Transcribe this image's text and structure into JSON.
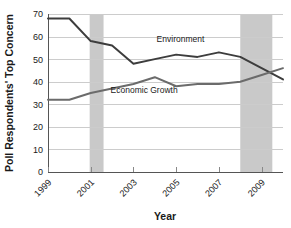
{
  "chart_data": {
    "type": "line",
    "title": "",
    "xlabel": "Year",
    "ylabel": "Poll Respondents' Top Concern",
    "xlim": [
      1999,
      2010
    ],
    "ylim": [
      0,
      70
    ],
    "grid": true,
    "legend_position": "inline-annotation",
    "y_ticks": [
      0,
      10,
      20,
      30,
      40,
      50,
      60,
      70
    ],
    "y_tick_labels": [
      "0",
      "10",
      "20",
      "30",
      "40",
      "50",
      "60",
      "70"
    ],
    "x_ticks": [
      1999,
      2001,
      2003,
      2005,
      2007,
      2009
    ],
    "x_tick_labels": [
      "1999",
      "2001",
      "2003",
      "2005",
      "2007",
      "2009"
    ],
    "x": [
      1999,
      2000,
      2001,
      2002,
      2003,
      2004,
      2005,
      2006,
      2007,
      2008,
      2009,
      2010
    ],
    "series": [
      {
        "name": "Environment",
        "color": "#3d3d3d",
        "values": [
          68,
          68,
          58,
          56,
          48,
          50,
          52,
          51,
          53,
          51,
          46,
          41
        ]
      },
      {
        "name": "Economic Growth",
        "color": "#6b6b6b",
        "values": [
          32,
          32,
          35,
          37,
          39,
          42,
          38,
          39,
          39,
          40,
          43,
          46
        ]
      }
    ],
    "annotations": [
      {
        "text": "Environment",
        "x": 2005.2,
        "y": 57.5
      },
      {
        "text": "Economic Growth",
        "x": 2003.5,
        "y": 35.0
      }
    ],
    "shaded_bands": [
      {
        "name": "recession-band-2001",
        "x_start": 2000.95,
        "x_end": 2001.6,
        "color": "#c9c9c9"
      },
      {
        "name": "recession-band-2008",
        "x_start": 2008.0,
        "x_end": 2009.5,
        "color": "#c9c9c9"
      }
    ],
    "colors": {
      "gridline": "#cccccc",
      "axis": "#555555",
      "plot_background": "#ffffff",
      "band": "#c9c9c9"
    }
  }
}
